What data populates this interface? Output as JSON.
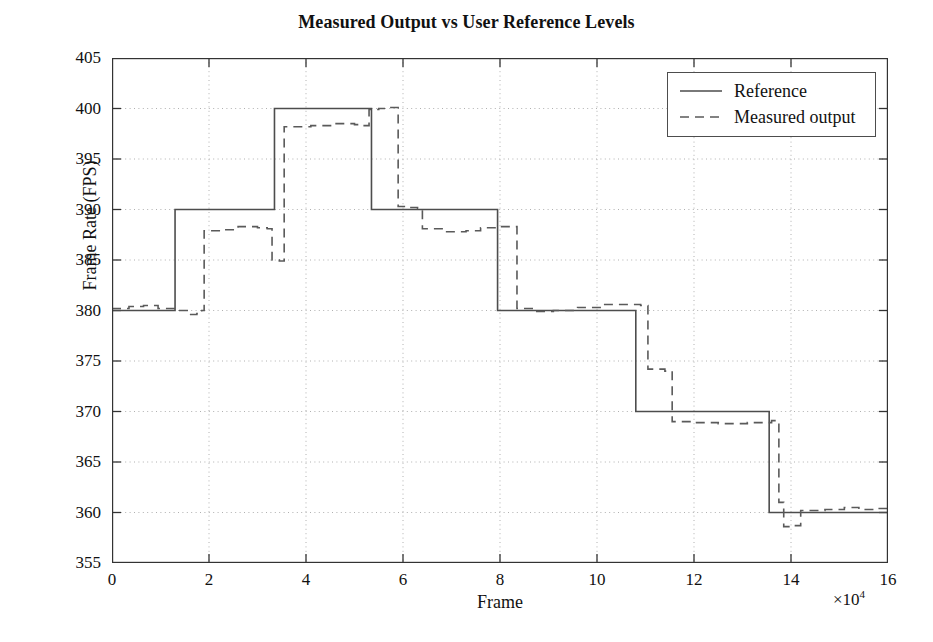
{
  "chart_data": {
    "type": "line",
    "title": "Measured Output vs User Reference Levels",
    "xlabel": "Frame",
    "ylabel": "Frame Rate (FPS)",
    "x_exponent": "×10",
    "x_exponent_power": "4",
    "xlim": [
      0,
      16
    ],
    "ylim": [
      355,
      405
    ],
    "xticks": [
      0,
      2,
      4,
      6,
      8,
      10,
      12,
      14,
      16
    ],
    "yticks": [
      355,
      360,
      365,
      370,
      375,
      380,
      385,
      390,
      395,
      400,
      405
    ],
    "grid": true,
    "grid_style": "dotted",
    "legend_position": "upper-right",
    "legend": [
      "Reference",
      "Measured output"
    ],
    "series": [
      {
        "name": "Reference",
        "style": "solid",
        "color": "#4d4d4d",
        "step": true,
        "points": [
          [
            0.0,
            380
          ],
          [
            1.3,
            380
          ],
          [
            1.3,
            390
          ],
          [
            3.35,
            390
          ],
          [
            3.35,
            400
          ],
          [
            5.35,
            400
          ],
          [
            5.35,
            390
          ],
          [
            7.95,
            390
          ],
          [
            7.95,
            380
          ],
          [
            10.8,
            380
          ],
          [
            10.8,
            370
          ],
          [
            13.55,
            370
          ],
          [
            13.55,
            360
          ],
          [
            16.0,
            360
          ]
        ]
      },
      {
        "name": "Measured output",
        "style": "dashed",
        "color": "#5a5a5a",
        "step": true,
        "points": [
          [
            0.0,
            380.2
          ],
          [
            0.35,
            380.4
          ],
          [
            0.65,
            380.5
          ],
          [
            0.95,
            380.2
          ],
          [
            1.3,
            380.0
          ],
          [
            1.55,
            379.6
          ],
          [
            1.75,
            379.7
          ],
          [
            1.85,
            380.0
          ],
          [
            1.9,
            387.9
          ],
          [
            2.3,
            388.0
          ],
          [
            2.6,
            388.3
          ],
          [
            3.0,
            388.2
          ],
          [
            3.2,
            388.1
          ],
          [
            3.3,
            385.0
          ],
          [
            3.45,
            384.9
          ],
          [
            3.55,
            398.2
          ],
          [
            4.1,
            398.3
          ],
          [
            4.6,
            398.5
          ],
          [
            5.0,
            398.4
          ],
          [
            5.2,
            398.3
          ],
          [
            5.3,
            399.9
          ],
          [
            5.5,
            400.0
          ],
          [
            5.7,
            400.1
          ],
          [
            5.9,
            390.3
          ],
          [
            6.1,
            390.2
          ],
          [
            6.3,
            390.1
          ],
          [
            6.4,
            388.1
          ],
          [
            6.9,
            387.8
          ],
          [
            7.3,
            387.9
          ],
          [
            7.6,
            388.2
          ],
          [
            7.95,
            388.3
          ],
          [
            8.25,
            388.3
          ],
          [
            8.35,
            380.2
          ],
          [
            8.7,
            379.9
          ],
          [
            9.1,
            380.0
          ],
          [
            9.6,
            380.3
          ],
          [
            10.1,
            380.6
          ],
          [
            10.6,
            380.6
          ],
          [
            10.9,
            380.5
          ],
          [
            11.05,
            374.2
          ],
          [
            11.4,
            374.0
          ],
          [
            11.55,
            369.0
          ],
          [
            12.0,
            368.9
          ],
          [
            12.5,
            368.8
          ],
          [
            13.1,
            368.9
          ],
          [
            13.6,
            369.1
          ],
          [
            13.75,
            361.0
          ],
          [
            13.85,
            358.6
          ],
          [
            14.05,
            358.7
          ],
          [
            14.2,
            360.2
          ],
          [
            14.7,
            360.3
          ],
          [
            15.1,
            360.5
          ],
          [
            15.4,
            360.3
          ],
          [
            15.8,
            360.4
          ],
          [
            16.0,
            360.4
          ]
        ]
      }
    ]
  },
  "legend": {
    "items": [
      {
        "label": "Reference",
        "style": "solid"
      },
      {
        "label": "Measured output",
        "style": "dashed"
      }
    ]
  },
  "colors": {
    "axis": "#333333",
    "grid": "#b0b0b0",
    "reference_line": "#4d4d4d",
    "measured_line": "#5a5a5a",
    "text": "#111111",
    "background": "#ffffff"
  }
}
